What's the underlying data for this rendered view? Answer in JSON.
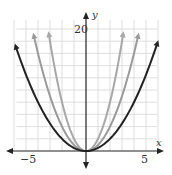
{
  "chart_data": {
    "type": "line",
    "title": "",
    "xlabel": "x",
    "ylabel": "y",
    "xlim": [
      -6,
      6
    ],
    "ylim": [
      -2,
      22
    ],
    "grid": true,
    "x_tick_labels": [
      {
        "value": -5,
        "label": "−5"
      },
      {
        "value": 5,
        "label": "5"
      }
    ],
    "y_tick_labels": [
      {
        "value": 20,
        "label": "20"
      }
    ],
    "x_grid_step": 1,
    "y_grid_step": 2,
    "series": [
      {
        "name": "y = 0.5x^2",
        "color": "#222222",
        "coef": 0.5,
        "x_range": [
          -5.83,
          5.92
        ]
      },
      {
        "name": "y = x^2",
        "color": "#9a9a9a",
        "coef": 1,
        "x_range": [
          -4.33,
          4.33
        ]
      },
      {
        "name": "y = 2x^2",
        "color": "#a8a8a8",
        "coef": 2,
        "x_range": [
          -3.08,
          3.08
        ]
      }
    ]
  },
  "labels": {
    "x_axis": "x",
    "y_axis": "y",
    "tick_neg5": "−5",
    "tick_5": "5",
    "tick_20": "20"
  }
}
